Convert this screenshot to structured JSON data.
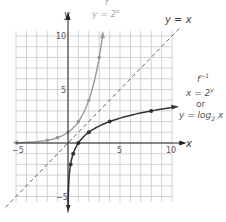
{
  "chart_data": {
    "type": "line",
    "title": "",
    "xlabel": "x",
    "ylabel": "y",
    "xlim": [
      -5,
      10
    ],
    "ylim": [
      -6,
      10
    ],
    "grid": true,
    "x_ticks": [
      {
        "value": -5,
        "label": "−5"
      },
      {
        "value": 5,
        "label": "5"
      },
      {
        "value": 10,
        "label": "10"
      }
    ],
    "y_ticks": [
      {
        "value": 10,
        "label": "10"
      },
      {
        "value": 5,
        "label": "5"
      },
      {
        "value": -5,
        "label": "−5"
      }
    ],
    "series": [
      {
        "name": "f: y = 2^x",
        "color": "#9a9a9a",
        "style": "solid",
        "points": [
          [
            -5,
            0.03125
          ],
          [
            -4,
            0.0625
          ],
          [
            -3,
            0.125
          ],
          [
            -2,
            0.25
          ],
          [
            -1,
            0.5
          ],
          [
            0,
            1
          ],
          [
            1,
            2
          ],
          [
            2,
            4
          ],
          [
            3,
            8
          ]
        ],
        "marked_points": [
          [
            -2,
            0.25
          ],
          [
            -1,
            0.5
          ],
          [
            0,
            1
          ],
          [
            1,
            2
          ],
          [
            2,
            4
          ],
          [
            3,
            8
          ]
        ]
      },
      {
        "name": "f^-1: x = 2^y or y = log2 x",
        "color": "#333333",
        "style": "solid",
        "points": [
          [
            0.03125,
            -5
          ],
          [
            0.0625,
            -4
          ],
          [
            0.125,
            -3
          ],
          [
            0.25,
            -2
          ],
          [
            0.5,
            -1
          ],
          [
            1,
            0
          ],
          [
            2,
            1
          ],
          [
            4,
            2
          ],
          [
            8,
            3
          ],
          [
            10,
            3.32
          ]
        ],
        "marked_points": [
          [
            0.25,
            -2
          ],
          [
            0.5,
            -1
          ],
          [
            1,
            0
          ],
          [
            2,
            1
          ],
          [
            4,
            2
          ],
          [
            8,
            3
          ]
        ]
      },
      {
        "name": "y = x",
        "color": "#555555",
        "style": "dashed",
        "points": [
          [
            -6,
            -6
          ],
          [
            11,
            11
          ]
        ]
      }
    ],
    "annotations": [
      {
        "text": "f",
        "near": "top of y = 2^x curve"
      },
      {
        "text": "y = 2^x",
        "near": "top of y = 2^x curve"
      },
      {
        "text": "y = x",
        "near": "upper-right end of dashed line"
      },
      {
        "text": "f^-1",
        "near": "right of log curve"
      },
      {
        "text": "x = 2^y",
        "near": "right of log curve"
      },
      {
        "text": "or",
        "near": "right of log curve"
      },
      {
        "text": "y = log2 x",
        "near": "right of log curve"
      }
    ]
  },
  "labels": {
    "f_name": "f",
    "f_eq_lhs": "y = 2",
    "f_eq_exp": "x",
    "yx": "y = x",
    "finv_name": "f",
    "finv_exp": "−1",
    "finv_eq1_lhs": "x = 2",
    "finv_eq1_exp": "y",
    "or": "or",
    "finv_eq2_lhs": "y = log",
    "finv_eq2_sub": "2",
    "finv_eq2_rhs": " x",
    "x_axis": "x",
    "y_axis": "y",
    "tick_x_neg5": "−5",
    "tick_x_5": "5",
    "tick_x_10": "10",
    "tick_y_10": "10",
    "tick_y_5": "5",
    "tick_y_neg5": "−5"
  }
}
